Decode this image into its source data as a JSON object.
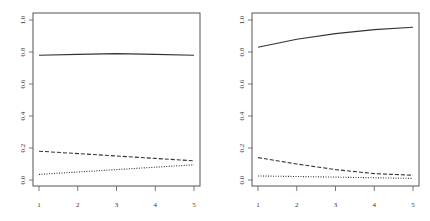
{
  "chart_data": [
    {
      "type": "line",
      "title": "",
      "xlabel": "",
      "ylabel": "",
      "x": [
        1,
        2,
        3,
        4,
        5
      ],
      "xticks": [
        "1",
        "2",
        "3",
        "4",
        "5"
      ],
      "yticks": [
        "0.0",
        "0.2",
        "0.4",
        "0.6",
        "0.8",
        "1.0"
      ],
      "ylim": [
        0,
        1
      ],
      "xlim": [
        1,
        5
      ],
      "grid": false,
      "legend": null,
      "series": [
        {
          "name": "solid",
          "style": "solid",
          "values": [
            0.78,
            0.785,
            0.79,
            0.785,
            0.78
          ]
        },
        {
          "name": "dashed",
          "style": "dashed",
          "values": [
            0.18,
            0.165,
            0.15,
            0.135,
            0.12
          ]
        },
        {
          "name": "dotted",
          "style": "dotted",
          "values": [
            0.035,
            0.05,
            0.065,
            0.08,
            0.095
          ]
        }
      ]
    },
    {
      "type": "line",
      "title": "",
      "xlabel": "",
      "ylabel": "",
      "x": [
        1,
        2,
        3,
        4,
        5
      ],
      "xticks": [
        "1",
        "2",
        "3",
        "4",
        "5"
      ],
      "yticks": [
        "0.0",
        "0.2",
        "0.4",
        "0.6",
        "0.8",
        "1.0"
      ],
      "ylim": [
        0,
        1
      ],
      "xlim": [
        1,
        5
      ],
      "grid": false,
      "legend": null,
      "series": [
        {
          "name": "solid",
          "style": "solid",
          "values": [
            0.83,
            0.88,
            0.915,
            0.94,
            0.955
          ]
        },
        {
          "name": "dashed",
          "style": "dashed",
          "values": [
            0.14,
            0.1,
            0.065,
            0.04,
            0.03
          ]
        },
        {
          "name": "dotted",
          "style": "dotted",
          "values": [
            0.025,
            0.022,
            0.018,
            0.014,
            0.01
          ]
        }
      ]
    }
  ],
  "colors": {
    "line": "#333333",
    "axis": "#555555",
    "background": "#ffffff"
  }
}
